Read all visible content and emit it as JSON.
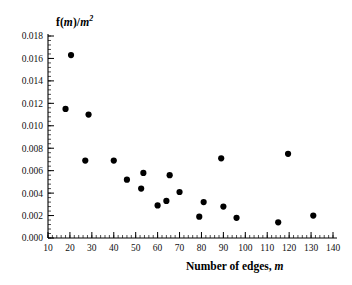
{
  "chart_data": {
    "type": "scatter",
    "title": "",
    "xlabel": "Number of edges, m",
    "ylabel": "f(m)/m^2",
    "xlabel_parts": {
      "text": "Number of edges,",
      "italic_var": "m"
    },
    "ylabel_parts": {
      "prefix": "f(",
      "italic_var": "m",
      "mid": ")/",
      "italic_var2": "m",
      "exponent": "2"
    },
    "xlim": [
      10,
      140
    ],
    "ylim": [
      0.0,
      0.018
    ],
    "xticks": [
      10,
      20,
      30,
      40,
      50,
      60,
      70,
      80,
      90,
      100,
      110,
      120,
      130,
      140
    ],
    "xtick_labels": [
      "10",
      "20",
      "30",
      "40",
      "50",
      "60",
      "70",
      "80",
      "90",
      "100",
      "110",
      "120",
      "130",
      "140"
    ],
    "yticks": [
      0.0,
      0.002,
      0.004,
      0.006,
      0.008,
      0.01,
      0.012,
      0.014,
      0.016,
      0.018
    ],
    "ytick_labels": [
      "0.000",
      "0.002",
      "0.004",
      "0.006",
      "0.008",
      "0.010",
      "0.012",
      "0.014",
      "0.016",
      "0.018"
    ],
    "x_minor_step": 2,
    "y_minor_step": 0.0004,
    "grid": false,
    "legend": null,
    "marker": {
      "shape": "circle",
      "color": "#000000",
      "size": 3.1
    },
    "points": [
      {
        "x": 18,
        "y": 0.0115
      },
      {
        "x": 20.5,
        "y": 0.0163
      },
      {
        "x": 27,
        "y": 0.0069
      },
      {
        "x": 28.5,
        "y": 0.011
      },
      {
        "x": 40,
        "y": 0.0069
      },
      {
        "x": 46,
        "y": 0.0052
      },
      {
        "x": 52.5,
        "y": 0.0044
      },
      {
        "x": 53.5,
        "y": 0.0058
      },
      {
        "x": 60,
        "y": 0.0029
      },
      {
        "x": 64,
        "y": 0.0033
      },
      {
        "x": 65.5,
        "y": 0.0056
      },
      {
        "x": 70,
        "y": 0.0041
      },
      {
        "x": 79,
        "y": 0.0019
      },
      {
        "x": 81,
        "y": 0.0032
      },
      {
        "x": 89,
        "y": 0.0071
      },
      {
        "x": 90,
        "y": 0.0028
      },
      {
        "x": 96,
        "y": 0.0018
      },
      {
        "x": 115,
        "y": 0.0014
      },
      {
        "x": 119.5,
        "y": 0.0075
      },
      {
        "x": 131,
        "y": 0.002
      }
    ]
  }
}
